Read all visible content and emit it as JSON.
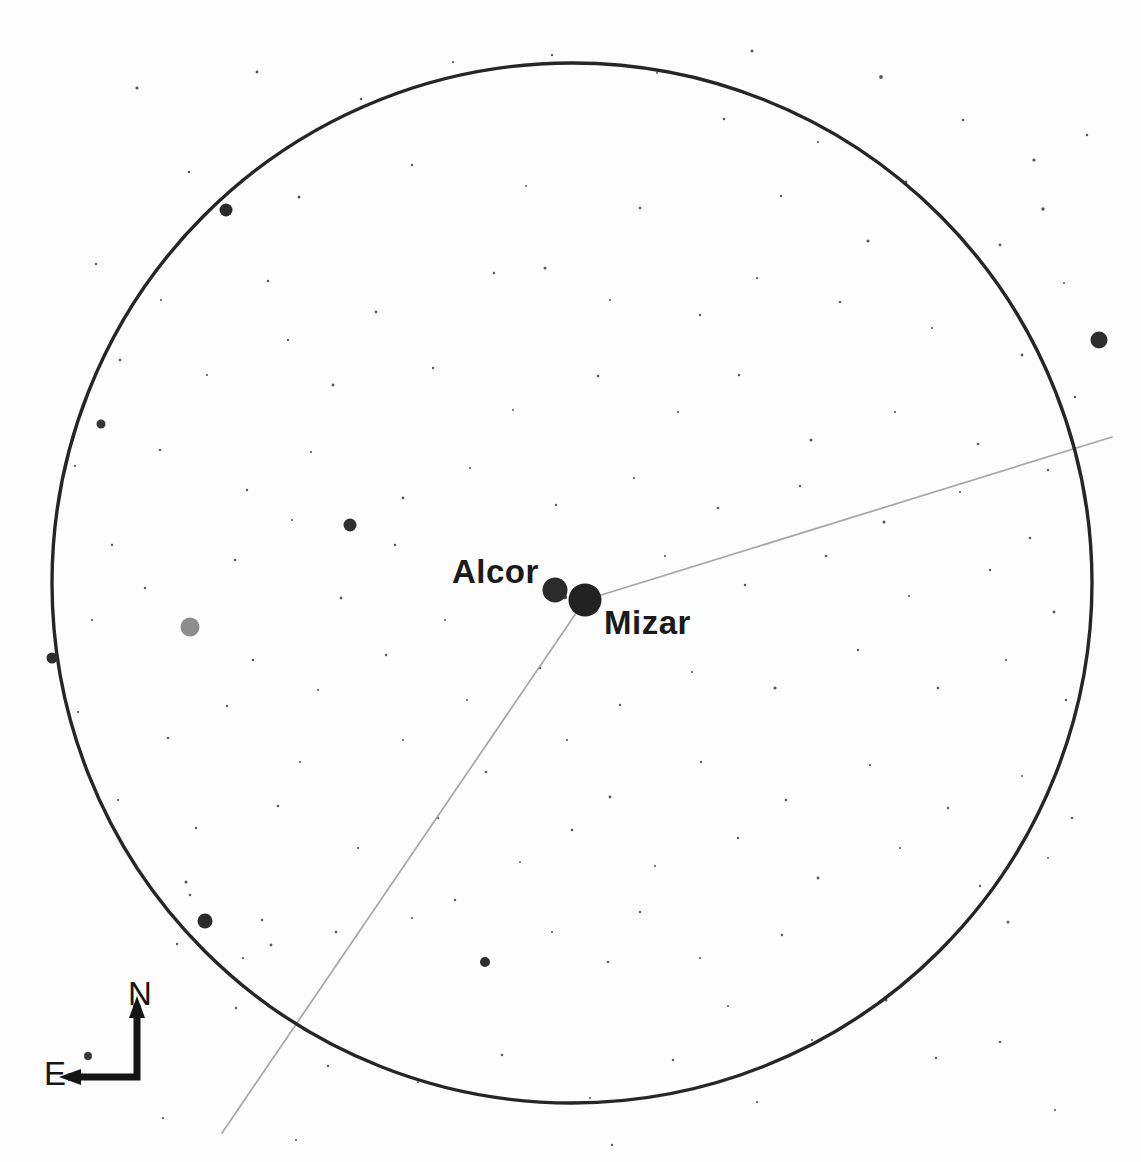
{
  "chart_type": "astronomical-finder-chart",
  "background_color": "#fdfdfd",
  "ink_color": "#1a1a1a",
  "line_color": "#9a9a9a",
  "labels": {
    "alcor": "Alcor",
    "mizar": "Mizar"
  },
  "compass": {
    "north_label": "N",
    "east_label": "E",
    "corner_x": 137,
    "corner_y": 1077,
    "north_tip_x": 137,
    "north_tip_y": 1005,
    "east_tip_x": 68,
    "east_tip_y": 1077,
    "stroke_width": 7,
    "color": "#151515"
  },
  "field_circle": {
    "cx": 572,
    "cy": 583,
    "r": 520,
    "stroke": "#262626",
    "stroke_width": 3.4
  },
  "constellation_line": {
    "stroke": "#a6a6a6",
    "stroke_width": 1.7,
    "vertex_x": 585,
    "vertex_y": 600,
    "segments": [
      {
        "x1": 585,
        "y1": 600,
        "x2": 1112,
        "y2": 437
      },
      {
        "x1": 585,
        "y1": 600,
        "x2": 222,
        "y2": 1133
      }
    ]
  },
  "named_stars": [
    {
      "name": "Alcor",
      "x": 555,
      "y": 590,
      "r": 12.5,
      "color": "#2b2b2b"
    },
    {
      "name": "Mizar",
      "x": 585,
      "y": 600,
      "r": 16.5,
      "color": "#222222"
    }
  ],
  "bright_stars": [
    {
      "x": 1099,
      "y": 340,
      "r": 8.5,
      "color": "#2d2d2d"
    },
    {
      "x": 226,
      "y": 210,
      "r": 6.5,
      "color": "#2b2b2b"
    },
    {
      "x": 350,
      "y": 525,
      "r": 6.5,
      "color": "#2e2e2e"
    },
    {
      "x": 190,
      "y": 627,
      "r": 9.5,
      "color": "#8d8d8d"
    },
    {
      "x": 205,
      "y": 921,
      "r": 7.5,
      "color": "#2a2a2a"
    },
    {
      "x": 52,
      "y": 658,
      "r": 5.5,
      "color": "#2e2e2e"
    },
    {
      "x": 101,
      "y": 424,
      "r": 4.5,
      "color": "#363636"
    },
    {
      "x": 485,
      "y": 962,
      "r": 5.0,
      "color": "#2f2f2f"
    },
    {
      "x": 88,
      "y": 1056,
      "r": 4.0,
      "color": "#3a3a3a"
    },
    {
      "x": 565,
      "y": 597,
      "r": 2.2,
      "color": "#4d4d4d"
    }
  ],
  "background_stars": [
    {
      "x": 137,
      "y": 88,
      "r": 1.6
    },
    {
      "x": 257,
      "y": 72,
      "r": 1.4
    },
    {
      "x": 361,
      "y": 99,
      "r": 1.2
    },
    {
      "x": 453,
      "y": 62,
      "r": 1.1
    },
    {
      "x": 552,
      "y": 55,
      "r": 1.2
    },
    {
      "x": 657,
      "y": 73,
      "r": 1.0
    },
    {
      "x": 752,
      "y": 51,
      "r": 1.5
    },
    {
      "x": 881,
      "y": 77,
      "r": 1.9
    },
    {
      "x": 963,
      "y": 120,
      "r": 1.3
    },
    {
      "x": 1034,
      "y": 160,
      "r": 1.6
    },
    {
      "x": 1087,
      "y": 135,
      "r": 1.2
    },
    {
      "x": 724,
      "y": 119,
      "r": 1.3
    },
    {
      "x": 818,
      "y": 142,
      "r": 1.1
    },
    {
      "x": 906,
      "y": 182,
      "r": 1.4
    },
    {
      "x": 189,
      "y": 172,
      "r": 1.3
    },
    {
      "x": 299,
      "y": 197,
      "r": 1.5
    },
    {
      "x": 412,
      "y": 165,
      "r": 1.2
    },
    {
      "x": 526,
      "y": 186,
      "r": 1.0
    },
    {
      "x": 640,
      "y": 208,
      "r": 1.3
    },
    {
      "x": 781,
      "y": 196,
      "r": 1.2
    },
    {
      "x": 868,
      "y": 241,
      "r": 1.5
    },
    {
      "x": 1000,
      "y": 245,
      "r": 1.4
    },
    {
      "x": 1064,
      "y": 283,
      "r": 1.1
    },
    {
      "x": 1043,
      "y": 209,
      "r": 1.7
    },
    {
      "x": 96,
      "y": 264,
      "r": 1.2
    },
    {
      "x": 161,
      "y": 300,
      "r": 1.1
    },
    {
      "x": 268,
      "y": 281,
      "r": 1.3
    },
    {
      "x": 376,
      "y": 312,
      "r": 1.4
    },
    {
      "x": 494,
      "y": 273,
      "r": 1.2
    },
    {
      "x": 545,
      "y": 268,
      "r": 1.5
    },
    {
      "x": 610,
      "y": 300,
      "r": 1.1
    },
    {
      "x": 700,
      "y": 315,
      "r": 1.2
    },
    {
      "x": 757,
      "y": 278,
      "r": 1.0
    },
    {
      "x": 840,
      "y": 302,
      "r": 1.3
    },
    {
      "x": 932,
      "y": 328,
      "r": 1.1
    },
    {
      "x": 1022,
      "y": 355,
      "r": 1.4
    },
    {
      "x": 1075,
      "y": 397,
      "r": 1.2
    },
    {
      "x": 120,
      "y": 360,
      "r": 1.3
    },
    {
      "x": 207,
      "y": 375,
      "r": 1.1
    },
    {
      "x": 288,
      "y": 340,
      "r": 1.2
    },
    {
      "x": 333,
      "y": 385,
      "r": 1.4
    },
    {
      "x": 433,
      "y": 368,
      "r": 1.2
    },
    {
      "x": 513,
      "y": 410,
      "r": 1.0
    },
    {
      "x": 598,
      "y": 376,
      "r": 1.3
    },
    {
      "x": 678,
      "y": 412,
      "r": 1.1
    },
    {
      "x": 739,
      "y": 375,
      "r": 1.2
    },
    {
      "x": 811,
      "y": 440,
      "r": 1.5
    },
    {
      "x": 895,
      "y": 412,
      "r": 1.1
    },
    {
      "x": 978,
      "y": 444,
      "r": 1.3
    },
    {
      "x": 1048,
      "y": 470,
      "r": 1.2
    },
    {
      "x": 75,
      "y": 466,
      "r": 1.1
    },
    {
      "x": 160,
      "y": 450,
      "r": 1.3
    },
    {
      "x": 247,
      "y": 490,
      "r": 1.2
    },
    {
      "x": 311,
      "y": 452,
      "r": 1.1
    },
    {
      "x": 403,
      "y": 498,
      "r": 1.4
    },
    {
      "x": 470,
      "y": 468,
      "r": 1.0
    },
    {
      "x": 556,
      "y": 505,
      "r": 1.2
    },
    {
      "x": 634,
      "y": 478,
      "r": 1.1
    },
    {
      "x": 718,
      "y": 508,
      "r": 1.3
    },
    {
      "x": 800,
      "y": 486,
      "r": 1.2
    },
    {
      "x": 884,
      "y": 522,
      "r": 1.5
    },
    {
      "x": 960,
      "y": 492,
      "r": 1.1
    },
    {
      "x": 1030,
      "y": 538,
      "r": 1.3
    },
    {
      "x": 1088,
      "y": 512,
      "r": 1.0
    },
    {
      "x": 112,
      "y": 545,
      "r": 1.2
    },
    {
      "x": 235,
      "y": 560,
      "r": 1.3
    },
    {
      "x": 292,
      "y": 520,
      "r": 1.1
    },
    {
      "x": 395,
      "y": 545,
      "r": 1.2
    },
    {
      "x": 445,
      "y": 620,
      "r": 1.0
    },
    {
      "x": 341,
      "y": 598,
      "r": 1.4
    },
    {
      "x": 665,
      "y": 556,
      "r": 1.1
    },
    {
      "x": 745,
      "y": 585,
      "r": 1.2
    },
    {
      "x": 826,
      "y": 556,
      "r": 1.3
    },
    {
      "x": 909,
      "y": 596,
      "r": 1.1
    },
    {
      "x": 990,
      "y": 570,
      "r": 1.2
    },
    {
      "x": 1054,
      "y": 612,
      "r": 1.4
    },
    {
      "x": 92,
      "y": 620,
      "r": 1.1
    },
    {
      "x": 145,
      "y": 588,
      "r": 1.2
    },
    {
      "x": 253,
      "y": 660,
      "r": 1.3
    },
    {
      "x": 318,
      "y": 690,
      "r": 1.1
    },
    {
      "x": 386,
      "y": 655,
      "r": 1.2
    },
    {
      "x": 467,
      "y": 700,
      "r": 1.0
    },
    {
      "x": 540,
      "y": 668,
      "r": 1.3
    },
    {
      "x": 620,
      "y": 705,
      "r": 1.2
    },
    {
      "x": 692,
      "y": 672,
      "r": 1.1
    },
    {
      "x": 775,
      "y": 688,
      "r": 1.6
    },
    {
      "x": 858,
      "y": 650,
      "r": 1.2
    },
    {
      "x": 938,
      "y": 688,
      "r": 1.3
    },
    {
      "x": 1006,
      "y": 660,
      "r": 1.1
    },
    {
      "x": 1066,
      "y": 700,
      "r": 1.2
    },
    {
      "x": 78,
      "y": 712,
      "r": 1.1
    },
    {
      "x": 168,
      "y": 738,
      "r": 1.3
    },
    {
      "x": 227,
      "y": 706,
      "r": 1.2
    },
    {
      "x": 300,
      "y": 762,
      "r": 1.1
    },
    {
      "x": 403,
      "y": 740,
      "r": 1.0
    },
    {
      "x": 486,
      "y": 772,
      "r": 1.3
    },
    {
      "x": 567,
      "y": 740,
      "r": 1.1
    },
    {
      "x": 610,
      "y": 797,
      "r": 1.4
    },
    {
      "x": 701,
      "y": 762,
      "r": 1.2
    },
    {
      "x": 786,
      "y": 800,
      "r": 1.3
    },
    {
      "x": 870,
      "y": 765,
      "r": 1.1
    },
    {
      "x": 948,
      "y": 808,
      "r": 1.2
    },
    {
      "x": 1022,
      "y": 776,
      "r": 1.0
    },
    {
      "x": 1072,
      "y": 818,
      "r": 1.3
    },
    {
      "x": 118,
      "y": 800,
      "r": 1.1
    },
    {
      "x": 196,
      "y": 828,
      "r": 1.2
    },
    {
      "x": 278,
      "y": 806,
      "r": 1.3
    },
    {
      "x": 358,
      "y": 848,
      "r": 1.1
    },
    {
      "x": 438,
      "y": 818,
      "r": 1.2
    },
    {
      "x": 520,
      "y": 862,
      "r": 1.0
    },
    {
      "x": 572,
      "y": 830,
      "r": 1.3
    },
    {
      "x": 655,
      "y": 866,
      "r": 1.1
    },
    {
      "x": 738,
      "y": 838,
      "r": 1.2
    },
    {
      "x": 818,
      "y": 878,
      "r": 1.4
    },
    {
      "x": 900,
      "y": 848,
      "r": 1.1
    },
    {
      "x": 980,
      "y": 886,
      "r": 1.2
    },
    {
      "x": 1048,
      "y": 858,
      "r": 1.0
    },
    {
      "x": 186,
      "y": 882,
      "r": 1.5
    },
    {
      "x": 190,
      "y": 895,
      "r": 1.3
    },
    {
      "x": 262,
      "y": 920,
      "r": 1.2
    },
    {
      "x": 243,
      "y": 958,
      "r": 1.1
    },
    {
      "x": 271,
      "y": 945,
      "r": 1.4
    },
    {
      "x": 177,
      "y": 944,
      "r": 1.2
    },
    {
      "x": 336,
      "y": 932,
      "r": 1.3
    },
    {
      "x": 412,
      "y": 918,
      "r": 1.1
    },
    {
      "x": 455,
      "y": 900,
      "r": 1.2
    },
    {
      "x": 552,
      "y": 932,
      "r": 1.0
    },
    {
      "x": 608,
      "y": 962,
      "r": 1.3
    },
    {
      "x": 640,
      "y": 912,
      "r": 1.2
    },
    {
      "x": 700,
      "y": 958,
      "r": 1.1
    },
    {
      "x": 782,
      "y": 935,
      "r": 1.2
    },
    {
      "x": 886,
      "y": 1000,
      "r": 1.4
    },
    {
      "x": 866,
      "y": 1012,
      "r": 1.1
    },
    {
      "x": 936,
      "y": 1058,
      "r": 1.2
    },
    {
      "x": 812,
      "y": 1040,
      "r": 1.0
    },
    {
      "x": 1000,
      "y": 1042,
      "r": 1.3
    },
    {
      "x": 1055,
      "y": 1110,
      "r": 1.1
    },
    {
      "x": 328,
      "y": 1066,
      "r": 1.2
    },
    {
      "x": 418,
      "y": 1082,
      "r": 1.0
    },
    {
      "x": 502,
      "y": 1055,
      "r": 1.3
    },
    {
      "x": 590,
      "y": 1098,
      "r": 1.1
    },
    {
      "x": 673,
      "y": 1060,
      "r": 1.2
    },
    {
      "x": 757,
      "y": 1102,
      "r": 1.0
    },
    {
      "x": 236,
      "y": 1008,
      "r": 1.2
    },
    {
      "x": 163,
      "y": 1118,
      "r": 1.1
    },
    {
      "x": 296,
      "y": 1140,
      "r": 1.0
    },
    {
      "x": 612,
      "y": 1145,
      "r": 1.2
    },
    {
      "x": 1008,
      "y": 922,
      "r": 1.5
    },
    {
      "x": 728,
      "y": 1006,
      "r": 1.1
    }
  ]
}
